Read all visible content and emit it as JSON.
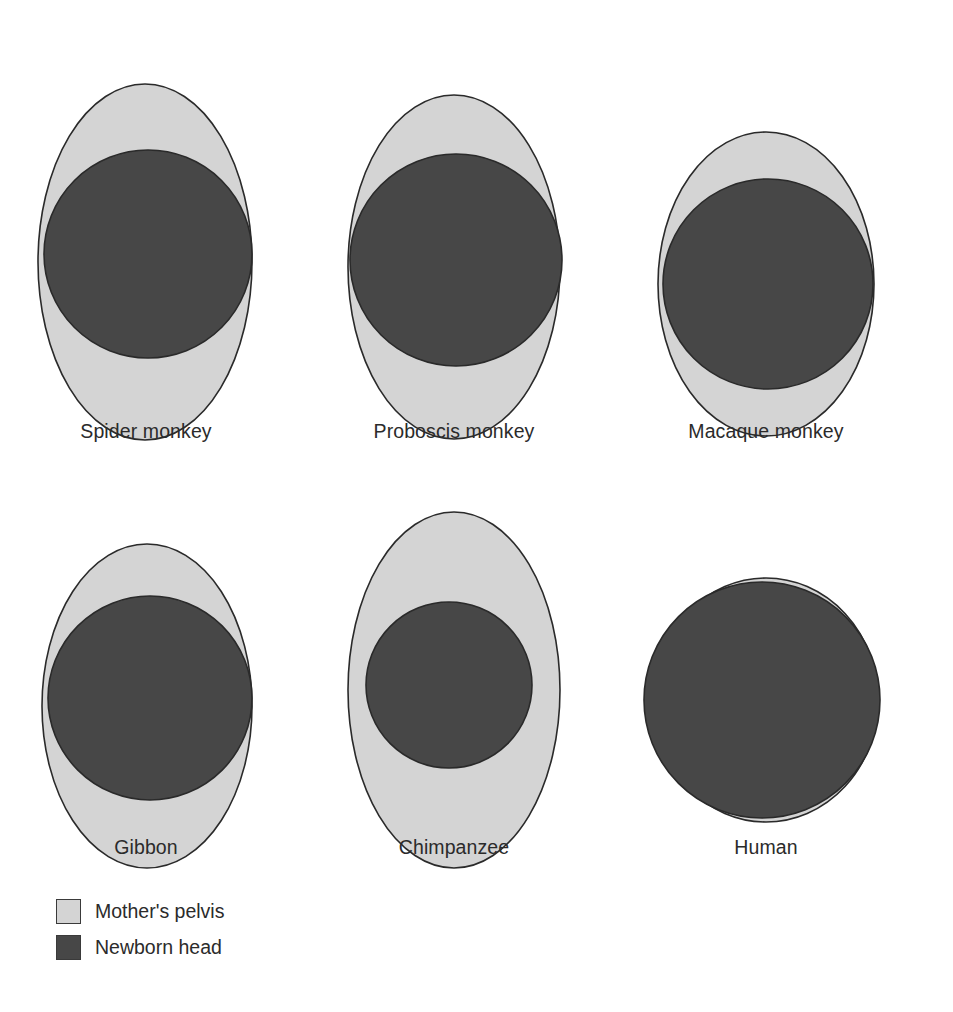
{
  "figure": {
    "type": "comparative-anatomy-diagram",
    "width": 953,
    "height": 1012,
    "background": "#ffffff"
  },
  "colors": {
    "pelvis_fill": "#d4d4d4",
    "head_fill": "#474747",
    "outline": "#2a2a2a",
    "label_text": "#2b2b2b",
    "background": "#ffffff"
  },
  "chart_data": {
    "type": "diagram",
    "title": "",
    "legend_position": "bottom-left",
    "series": [
      {
        "name": "Mother's pelvis",
        "color": "#d4d4d4"
      },
      {
        "name": "Newborn head",
        "color": "#474747"
      }
    ],
    "panels": [
      {
        "label": "Spider monkey",
        "pelvis": {
          "cx": 107,
          "cy": 220,
          "rx": 107,
          "ry": 178,
          "shape": "tall-ellipse"
        },
        "head": {
          "cx": 110,
          "cy": 212,
          "r": 104,
          "shape": "circle"
        },
        "fit": "head fills upper pelvis, clear crescent below"
      },
      {
        "label": "Proboscis monkey",
        "pelvis": {
          "cx": 110,
          "cy": 212,
          "rx": 106,
          "ry": 172,
          "shape": "tall-ellipse"
        },
        "head": {
          "cx": 112,
          "cy": 205,
          "r": 106,
          "shape": "circle"
        },
        "fit": "head nearly fills pelvis, touches left margin"
      },
      {
        "label": "Macaque monkey",
        "pelvis": {
          "cx": 110,
          "cy": 202,
          "rx": 108,
          "ry": 152,
          "shape": "rounded-ellipse"
        },
        "head": {
          "cx": 112,
          "cy": 202,
          "r": 105,
          "shape": "circle"
        },
        "fit": "tightest fit, head almost entirely fills pelvis"
      },
      {
        "label": "Gibbon",
        "pelvis": {
          "cx": 107,
          "cy": 188,
          "rx": 105,
          "ry": 162,
          "shape": "tall-ellipse"
        },
        "head": {
          "cx": 110,
          "cy": 180,
          "r": 102,
          "shape": "circle"
        },
        "fit": "head fills upper pelvis, narrow crescent below"
      },
      {
        "label": "Chimpanzee",
        "pelvis": {
          "cx": 110,
          "cy": 190,
          "rx": 106,
          "ry": 178,
          "shape": "tall-ellipse"
        },
        "head": {
          "cx": 105,
          "cy": 185,
          "r": 83,
          "shape": "circle"
        },
        "fit": "most clearance, small head within roomy pelvis"
      },
      {
        "label": "Human",
        "pelvis": {
          "cx": 112,
          "cy": 160,
          "rx": 112,
          "ry": 122,
          "shape": "wide-ellipse"
        },
        "head": {
          "cx": 108,
          "cy": 160,
          "r": 118,
          "shape": "circle"
        },
        "fit": "head overflows pelvis top and bottom; widened flattened inlet"
      }
    ]
  },
  "panel_layout": [
    {
      "left": 0,
      "top": 42,
      "width": 292,
      "label_top": 378
    },
    {
      "left": 308,
      "top": 55,
      "width": 292,
      "label_top": 365
    },
    {
      "left": 620,
      "top": 82,
      "width": 292,
      "label_top": 338
    },
    {
      "left": 0,
      "top": 518,
      "width": 292,
      "label_top": 318
    },
    {
      "left": 308,
      "top": 500,
      "width": 292,
      "label_top": 336
    },
    {
      "left": 620,
      "top": 540,
      "width": 292,
      "label_top": 296
    }
  ],
  "legend": {
    "items": [
      {
        "label": "Mother's pelvis",
        "color": "#d4d4d4"
      },
      {
        "label": "Newborn head",
        "color": "#474747"
      }
    ]
  }
}
